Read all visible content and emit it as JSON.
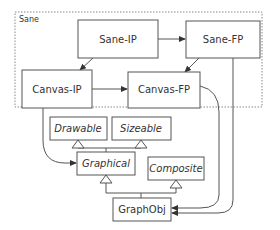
{
  "diagram": {
    "frame": {
      "label": "Sane"
    },
    "nodes": {
      "sane_ip": {
        "label": "Sane-IP",
        "style": "normal"
      },
      "sane_fp": {
        "label": "Sane-FP",
        "style": "normal"
      },
      "canvas_ip": {
        "label": "Canvas-IP",
        "style": "normal"
      },
      "canvas_fp": {
        "label": "Canvas-FP",
        "style": "normal"
      },
      "drawable": {
        "label": "Drawable",
        "style": "italic"
      },
      "sizeable": {
        "label": "Sizeable",
        "style": "italic"
      },
      "graphical": {
        "label": "Graphical",
        "style": "italic"
      },
      "composite": {
        "label": "Composite",
        "style": "italic"
      },
      "graphobj": {
        "label": "GraphObj",
        "style": "normal"
      }
    },
    "edges": [
      {
        "from": "Sane-IP",
        "to": "Sane-FP",
        "type": "association"
      },
      {
        "from": "Sane-IP",
        "to": "Canvas-IP",
        "type": "association"
      },
      {
        "from": "Sane-FP",
        "to": "Canvas-FP",
        "type": "association"
      },
      {
        "from": "Canvas-IP",
        "to": "Canvas-FP",
        "type": "association"
      },
      {
        "from": "Canvas-IP",
        "to": "Graphical",
        "type": "association"
      },
      {
        "from": "Canvas-FP",
        "to": "GraphObj",
        "type": "association"
      },
      {
        "from": "Sane-FP",
        "to": "GraphObj",
        "type": "association"
      },
      {
        "from": "Graphical",
        "to": "Drawable",
        "type": "inheritance"
      },
      {
        "from": "Graphical",
        "to": "Sizeable",
        "type": "inheritance"
      },
      {
        "from": "GraphObj",
        "to": "Graphical",
        "type": "inheritance"
      },
      {
        "from": "GraphObj",
        "to": "Composite",
        "type": "inheritance"
      }
    ],
    "colors": {
      "stroke": "#555555",
      "text": "#333333",
      "frame": "#888888"
    }
  }
}
